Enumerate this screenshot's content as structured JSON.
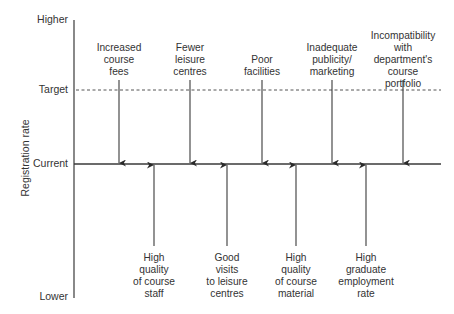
{
  "chart_data": {
    "type": "force-field-diagram",
    "ylabel": "Registration rate",
    "levels": [
      {
        "label": "Higher",
        "y": 20
      },
      {
        "label": "Target",
        "y": 90
      },
      {
        "label": "Current",
        "y": 164
      },
      {
        "label": "Lower",
        "y": 297
      }
    ],
    "restraining_forces": [
      {
        "label": "Increased\ncourse\nfees",
        "x": 119
      },
      {
        "label": "Fewer\nleisure\ncentres",
        "x": 190
      },
      {
        "label": "Poor\nfacilities",
        "x": 262
      },
      {
        "label": "Inadequate\npublicity/\nmarketing",
        "x": 332
      },
      {
        "label": "Incompatibility\nwith department's\ncourse\nportfolio",
        "x": 403
      }
    ],
    "driving_forces": [
      {
        "label": "High\nquality\nof course\nstaff",
        "x": 154
      },
      {
        "label": "Good\nvisits\nto leisure\ncentres",
        "x": 227
      },
      {
        "label": "High\nquality\nof course\nmaterial",
        "x": 296
      },
      {
        "label": "High\ngraduate\nemployment\nrate",
        "x": 366
      }
    ]
  },
  "colors": {
    "line": "#3a3a3a",
    "text": "#333333"
  }
}
